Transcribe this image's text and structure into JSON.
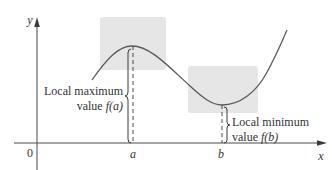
{
  "figure": {
    "type": "local-extrema-diagram",
    "axes": {
      "x_label": "x",
      "y_label": "y",
      "origin_label": "0",
      "x_ticks": [
        {
          "label": "a",
          "meaning": "location of local maximum"
        },
        {
          "label": "b",
          "meaning": "location of local minimum"
        }
      ]
    },
    "annotations": {
      "max": {
        "line1": "Local maximum",
        "line2_prefix": "value ",
        "line2_func": "f(a)"
      },
      "min": {
        "line1": "Local minimum",
        "line2_prefix": "value ",
        "line2_func": "f(b)"
      }
    },
    "colors": {
      "curve": "#5a5a5a",
      "axis": "#4a4a4a",
      "highlight_box": "#e6e6e6",
      "text": "#333333",
      "background": "#ffffff"
    }
  }
}
